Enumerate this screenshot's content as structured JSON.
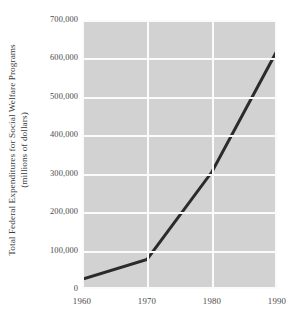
{
  "chart_data": {
    "type": "line",
    "title": "",
    "xlabel": "",
    "ylabel_line1": "Total Federal Expenditures for Social Welfare Programs",
    "ylabel_line2": "(millions of dollars)",
    "x": [
      1960,
      1970,
      1980,
      1990
    ],
    "values": [
      25000,
      77000,
      305000,
      620000
    ],
    "series": [
      {
        "name": "Total Federal Expenditures for Social Welfare Programs",
        "values": [
          25000,
          77000,
          305000,
          620000
        ]
      }
    ],
    "xlim": [
      1960,
      1990
    ],
    "ylim": [
      0,
      700000
    ],
    "xticks": [
      "1960",
      "1970",
      "1980",
      "1990"
    ],
    "xtick_values": [
      1960,
      1970,
      1980,
      1990
    ],
    "yticks": [
      "0",
      "100,000",
      "200,000",
      "300,000",
      "400,000",
      "500,000",
      "600,000",
      "700,000"
    ],
    "ytick_values": [
      0,
      100000,
      200000,
      300000,
      400000,
      500000,
      600000,
      700000
    ],
    "grid": true,
    "legend": "none",
    "plot_background_color": "#d2d2d2",
    "grid_color": "#fbfbfb",
    "line_color": "#2b2b2b",
    "line_width": 3
  }
}
